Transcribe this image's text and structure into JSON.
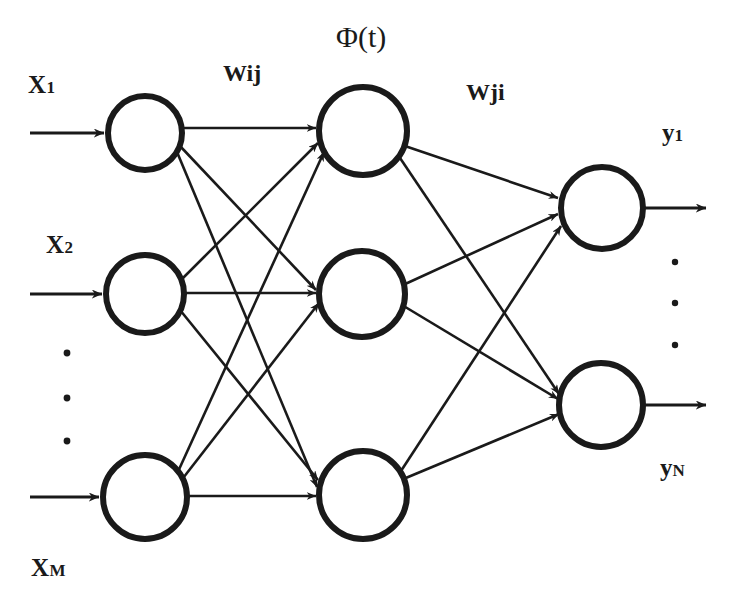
{
  "diagram": {
    "stroke_color": "#1a1a1a",
    "background_color": "#ffffff",
    "labels": {
      "activation": "Φ(t)",
      "weights_input_hidden": "Wij",
      "weights_hidden_output": "Wji"
    },
    "inputs": [
      {
        "name": "X",
        "subscript": "1"
      },
      {
        "name": "X",
        "subscript": "2"
      },
      {
        "name": "X",
        "subscript": "M"
      }
    ],
    "outputs": [
      {
        "name": "y",
        "subscript": "1"
      },
      {
        "name": "y",
        "subscript": "N"
      }
    ],
    "ellipsis": {
      "input_dots": "•",
      "output_dots": "•",
      "count": 3
    },
    "layers": [
      {
        "id": "input-layer",
        "name": "Input layer",
        "node_count": 3,
        "nodes": [
          {
            "id": "input-node-1",
            "cx": 145,
            "cy": 133,
            "r": 37
          },
          {
            "id": "input-node-2",
            "cx": 145,
            "cy": 294,
            "r": 39
          },
          {
            "id": "input-node-3",
            "cx": 145,
            "cy": 497,
            "r": 42
          }
        ]
      },
      {
        "id": "hidden-layer",
        "name": "Hidden layer",
        "node_count": 3,
        "nodes": [
          {
            "id": "hidden-node-1",
            "cx": 363,
            "cy": 131,
            "r": 44
          },
          {
            "id": "hidden-node-2",
            "cx": 362,
            "cy": 294,
            "r": 43
          },
          {
            "id": "hidden-node-3",
            "cx": 363,
            "cy": 495,
            "r": 44
          }
        ]
      },
      {
        "id": "output-layer",
        "name": "Output layer",
        "node_count": 2,
        "nodes": [
          {
            "id": "output-node-1",
            "cx": 602,
            "cy": 208,
            "r": 41
          },
          {
            "id": "output-node-2",
            "cx": 601,
            "cy": 405,
            "r": 42
          }
        ]
      }
    ],
    "connections": {
      "input_to_hidden": "fully-connected",
      "hidden_to_output": "fully-connected",
      "input_to_hidden_count": 9,
      "hidden_to_output_count": 6
    }
  }
}
